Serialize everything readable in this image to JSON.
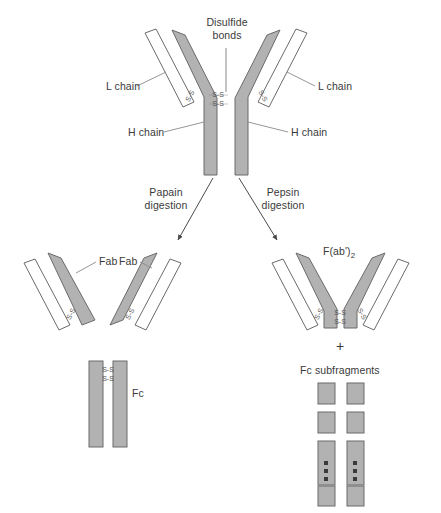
{
  "figure": {
    "background_color": "#ffffff",
    "heavy_chain_fill": "#b2b2b2",
    "light_chain_fill": "#ffffff",
    "stroke_color": "#6b6b6b",
    "text_color": "#3a3a3a",
    "subfragment_fill": "#b2b2b2"
  },
  "intact_antibody": {
    "disulfide_label": {
      "line1": "Disulfide",
      "line2": "bonds"
    },
    "light_chain_left_label": "L chain",
    "light_chain_right_label": "L chain",
    "heavy_chain_left_label": "H chain",
    "heavy_chain_right_label": "H chain",
    "bond_glyph": "S-S"
  },
  "digestion": {
    "papain": {
      "line1": "Papain",
      "line2": "digestion"
    },
    "pepsin": {
      "line1": "Pepsin",
      "line2": "digestion"
    }
  },
  "papain_products": {
    "fab_left_label": "Fab",
    "fab_right_label": "Fab",
    "fc_label": "Fc"
  },
  "pepsin_products": {
    "fab2_label_main": "F(ab')",
    "fab2_label_subscript": "2",
    "plus_symbol": "+",
    "fc_subfragments_label": "Fc subfragments"
  }
}
